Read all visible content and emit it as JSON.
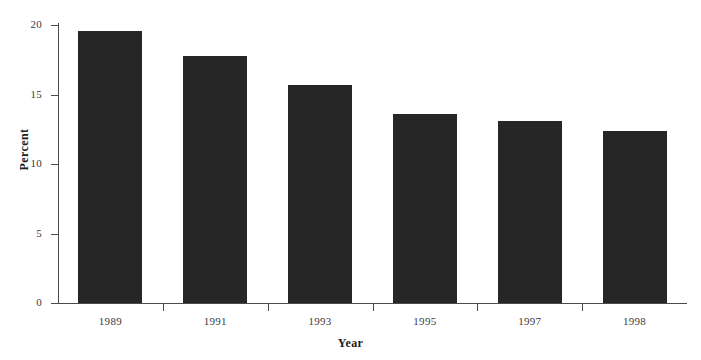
{
  "chart_data": {
    "type": "bar",
    "title": "",
    "xlabel": "Year",
    "ylabel": "Percent",
    "categories": [
      "1989",
      "1991",
      "1993",
      "1995",
      "1997",
      "1998"
    ],
    "values": [
      19.6,
      17.8,
      15.7,
      13.6,
      13.1,
      12.4
    ],
    "ylim": [
      0,
      20
    ],
    "yticks": [
      0,
      5,
      10,
      15,
      20
    ],
    "ytick_labels": [
      "0",
      "5",
      "10",
      "15",
      "20"
    ],
    "grid": false,
    "legend": null,
    "bar_color": "#262626",
    "axis_color": "#4a4a4a",
    "background_color": "#ffffff"
  }
}
